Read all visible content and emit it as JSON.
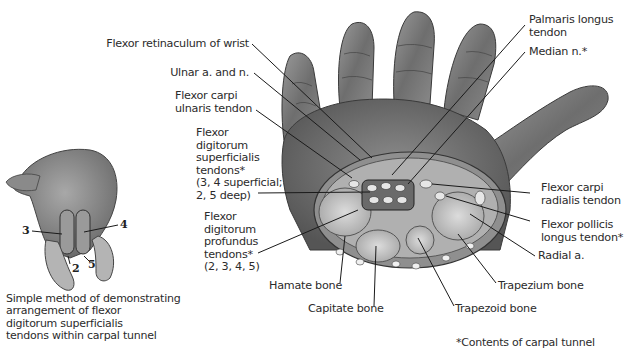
{
  "figure": {
    "title_partial": "",
    "main_illustration": "hand-palm-with-carpal-tunnel-cross-section",
    "inset_illustration": "hand-fist-demonstration",
    "colors": {
      "background": "#ffffff",
      "text": "#2b2b2b",
      "leader_line": "#1a1a1a",
      "skin_dark": "#4a4a4a",
      "skin_light": "#b8b8b8"
    }
  },
  "labels_left": [
    {
      "id": "flexor-retinaculum",
      "lines": [
        "Flexor retinaculum of wrist"
      ]
    },
    {
      "id": "ulnar-a-n",
      "lines": [
        "Ulnar a. and n."
      ]
    },
    {
      "id": "fcu-tendon",
      "lines": [
        "Flexor carpi",
        "ulnaris tendon"
      ]
    },
    {
      "id": "fds-tendons",
      "lines": [
        "Flexor",
        "digitorum",
        "superficialis",
        "tendons*",
        "(3, 4 superficial;",
        "2, 5 deep)"
      ]
    },
    {
      "id": "fdp-tendons",
      "lines": [
        "Flexor",
        "digitorum",
        "profundus",
        "tendons*",
        "(2, 3, 4, 5)"
      ]
    }
  ],
  "labels_right": [
    {
      "id": "palmaris-longus",
      "lines": [
        "Palmaris longus",
        "tendon"
      ]
    },
    {
      "id": "median-n",
      "lines": [
        "Median n.*"
      ]
    },
    {
      "id": "fcr-tendon",
      "lines": [
        "Flexor carpi",
        "radialis tendon"
      ]
    },
    {
      "id": "fpl-tendon",
      "lines": [
        "Flexor pollicis",
        "longus tendon*"
      ]
    },
    {
      "id": "radial-a",
      "lines": [
        "Radial a."
      ]
    }
  ],
  "labels_bottom": [
    {
      "id": "hamate",
      "text": "Hamate bone"
    },
    {
      "id": "capitate",
      "text": "Capitate bone"
    },
    {
      "id": "trapezoid",
      "text": "Trapezoid bone"
    },
    {
      "id": "trapezium",
      "text": "Trapezium bone"
    }
  ],
  "inset": {
    "finger_numbers": [
      "3",
      "4",
      "2",
      "5"
    ],
    "caption_lines": [
      "Simple method of demonstrating",
      "arrangement of flexor",
      "digitorum superficialis",
      "tendons within carpal tunnel"
    ]
  },
  "footnote": "*Contents of carpal tunnel"
}
